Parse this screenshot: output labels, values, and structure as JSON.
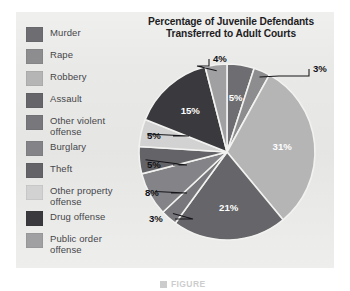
{
  "figure": {
    "title_line1": "Percentage of Juvenile Defendants",
    "title_line2": "Transferred to Adult Courts",
    "panel_color": "#e9e9e7",
    "caption_text": "FIGURE"
  },
  "legend": {
    "items": [
      {
        "label": "Murder",
        "color": "#6e6e72"
      },
      {
        "label": "Rape",
        "color": "#8d8d90"
      },
      {
        "label": "Robbery",
        "color": "#b5b5b6"
      },
      {
        "label": "Assault",
        "color": "#66666a"
      },
      {
        "label": "Other violent\noffense",
        "color": "#78787c"
      },
      {
        "label": "Burglary",
        "color": "#848488"
      },
      {
        "label": "Theft",
        "color": "#646468"
      },
      {
        "label": "Other property\noffense",
        "color": "#d2d2d2"
      },
      {
        "label": "Drug offense",
        "color": "#3a3a3e"
      },
      {
        "label": "Public order\noffense",
        "color": "#a0a0a3"
      }
    ]
  },
  "chart_data": {
    "type": "pie",
    "title": "Percentage of Juvenile Defendants Transferred to Adult Courts",
    "xlabel": "",
    "ylabel": "",
    "legend_position": "left",
    "grid": false,
    "value_suffix": "%",
    "categories": [
      "Murder",
      "Rape",
      "Robbery",
      "Assault",
      "Other violent offense",
      "Burglary",
      "Theft",
      "Other property offense",
      "Drug offense",
      "Public order offense"
    ],
    "values": [
      5,
      3,
      31,
      21,
      3,
      8,
      5,
      5,
      15,
      4
    ],
    "colors": [
      "#6e6e72",
      "#8d8d90",
      "#b5b5b6",
      "#66666a",
      "#78787c",
      "#848488",
      "#646468",
      "#d2d2d2",
      "#3a3a3e",
      "#a0a0a3"
    ],
    "labels": [
      "5%",
      "3%",
      "31%",
      "21%",
      "3%",
      "8%",
      "5%",
      "5%",
      "15%",
      "4%"
    ],
    "label_placement": [
      "inside",
      "outside",
      "inside",
      "inside",
      "outside",
      "outside",
      "outside",
      "outside",
      "inside",
      "outside"
    ],
    "start_angle_deg": 0,
    "direction": "clockwise",
    "total": 100
  }
}
